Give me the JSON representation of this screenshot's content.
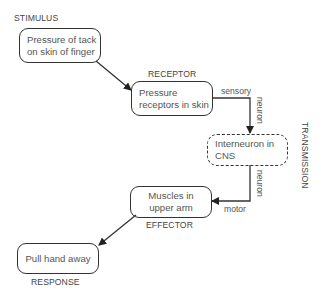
{
  "diagram": {
    "type": "reflex-arc flowchart",
    "stages": [
      {
        "id": "stimulus",
        "label": "STIMULUS",
        "text_lines": [
          "Pressure of tack",
          "on skin of finger"
        ]
      },
      {
        "id": "receptor",
        "label": "RECEPTOR",
        "text_lines": [
          "Pressure",
          "receptors in skin"
        ]
      },
      {
        "id": "interneuron",
        "label": "",
        "text_lines": [
          "Interneuron in",
          "CNS"
        ]
      },
      {
        "id": "effector",
        "label": "EFFECTOR",
        "text_lines": [
          "Muscles in",
          "upper arm"
        ]
      },
      {
        "id": "response",
        "label": "RESPONSE",
        "text_lines": [
          "Pull hand away"
        ]
      }
    ],
    "connectors": {
      "sensory": {
        "word1": "sensory",
        "word2": "neuron"
      },
      "motor": {
        "word1": "motor",
        "word2": "neuron"
      }
    },
    "side_label": "TRANSMISSION"
  }
}
